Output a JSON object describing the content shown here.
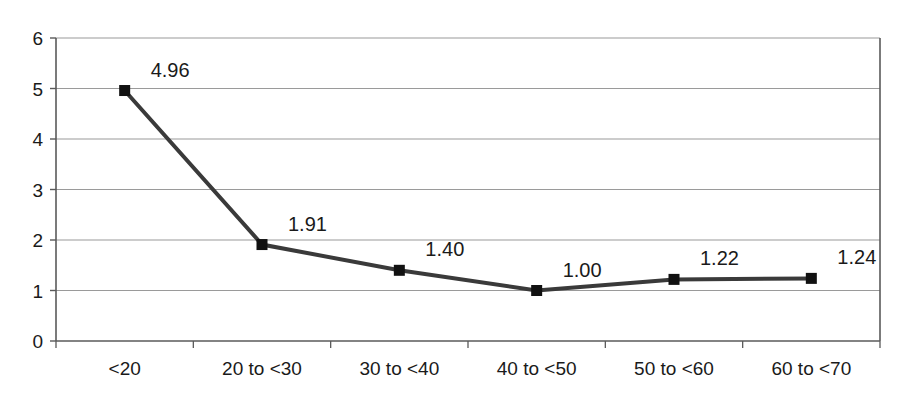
{
  "chart_data": {
    "type": "line",
    "title": "",
    "subtitle": "",
    "xlabel": "",
    "ylabel": "",
    "categories": [
      "<20",
      "20 to <30",
      "30 to <40",
      "40 to <50",
      "50 to <60",
      "60 to <70"
    ],
    "values": [
      4.96,
      1.91,
      1.4,
      1.0,
      1.22,
      1.24
    ],
    "point_labels": [
      "4.96",
      "1.91",
      "1.40",
      "1.00",
      "1.22",
      "1.24"
    ],
    "series": [
      {
        "name": "",
        "values": [
          4.96,
          1.91,
          1.4,
          1.0,
          1.22,
          1.24
        ]
      }
    ],
    "ylim": [
      0,
      6
    ],
    "y_ticks": [
      "0",
      "1",
      "2",
      "3",
      "4",
      "5",
      "6"
    ],
    "y_tick_values": [
      0,
      1,
      2,
      3,
      4,
      5,
      6
    ],
    "grid": true,
    "grid_axis": "y",
    "legend": false,
    "legend_position": "none",
    "marker": "square",
    "line_color": "#3a3a3a",
    "marker_color": "#111111",
    "grid_color": "#9a9a9a",
    "axis_color": "#5a5a5a",
    "background": "#ffffff"
  }
}
